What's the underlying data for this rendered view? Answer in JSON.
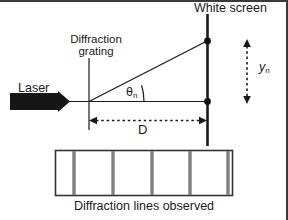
{
  "figure": {
    "caption": "Diffraction lines observed",
    "labels": {
      "white_screen": "White screen",
      "diffraction_grating_line1": "Diffraction",
      "diffraction_grating_line2": "grating",
      "laser": "Laser",
      "theta_symbol": "θ",
      "theta_subscript": "n",
      "y_symbol": "y",
      "y_subscript": "n",
      "distance": "D"
    },
    "colors": {
      "stroke": "#1a1a1a",
      "laser_body": "#161616",
      "fringe": "#808080",
      "panel_border": "#333333",
      "background": "#ffffff",
      "frame": "#3a3a3a"
    },
    "diffraction_panel": {
      "fringe_count": 5,
      "fringe_label": "diffraction-fringe"
    },
    "icon_names": {
      "laser": "laser-device-icon",
      "screen": "white-screen-line-icon",
      "grating": "diffraction-grating-line-icon",
      "beam": "diffracted-beam-ray",
      "axis": "optical-axis-line",
      "angle_arc": "angle-arc-icon",
      "yn_arrow": "yn-dimension-arrow",
      "d_arrow": "distance-dimension-arrow",
      "spot_top": "first-order-spot-dot",
      "spot_center": "central-spot-dot"
    }
  }
}
